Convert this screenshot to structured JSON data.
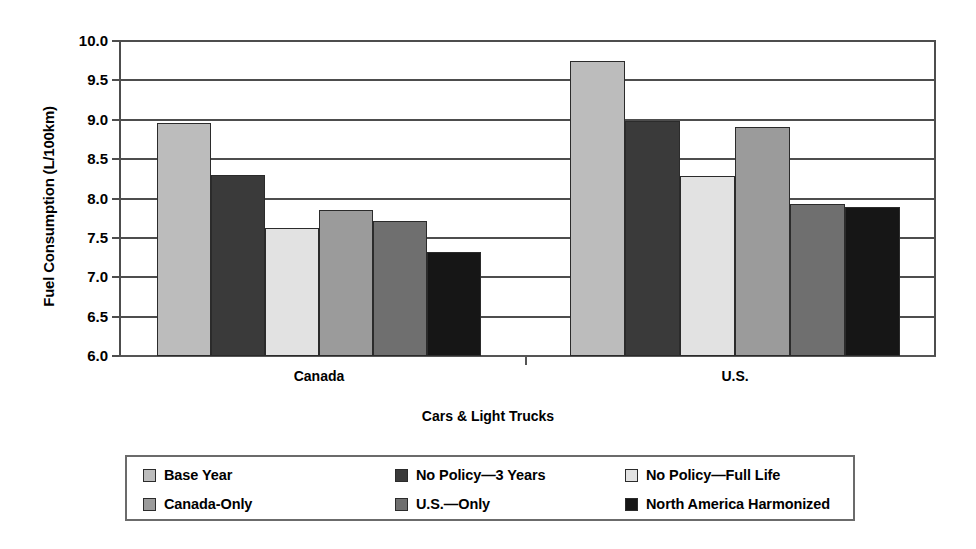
{
  "chart_data": {
    "type": "bar",
    "title": "",
    "xlabel": "Cars & Light Trucks",
    "ylabel": "Fuel Consumption (L/100km)",
    "ylim": [
      6.0,
      10.0
    ],
    "ytick_labels": [
      "10.0",
      "9.5",
      "9.0",
      "8.5",
      "8.0",
      "7.5",
      "7.0",
      "6.5",
      "6.0"
    ],
    "ytick_values": [
      10.0,
      9.5,
      9.0,
      8.5,
      8.0,
      7.5,
      7.0,
      6.5,
      6.0
    ],
    "grid": true,
    "legend_position": "below-axes",
    "categories": [
      "Canada",
      "U.S."
    ],
    "series": [
      {
        "name": "Base Year",
        "color": "#bcbcbc",
        "values": [
          8.96,
          9.74
        ]
      },
      {
        "name": "No Policy—3 Years",
        "color": "#3a3a3a",
        "values": [
          8.3,
          8.98
        ]
      },
      {
        "name": "No Policy—Full Life",
        "color": "#e2e2e2",
        "values": [
          7.62,
          8.28
        ]
      },
      {
        "name": "Canada-Only",
        "color": "#9b9b9b",
        "values": [
          7.85,
          8.91
        ]
      },
      {
        "name": "U.S.—Only",
        "color": "#6f6f6f",
        "values": [
          7.72,
          7.93
        ]
      },
      {
        "name": "North America Harmonized",
        "color": "#161616",
        "values": [
          7.32,
          7.89
        ]
      }
    ]
  },
  "legend": {
    "rows": [
      [
        {
          "label": "Base Year",
          "color": "#bcbcbc"
        },
        {
          "label": "No Policy—3 Years",
          "color": "#3a3a3a"
        },
        {
          "label": "No Policy—Full Life",
          "color": "#e2e2e2"
        }
      ],
      [
        {
          "label": "Canada-Only",
          "color": "#9b9b9b"
        },
        {
          "label": "U.S.—Only",
          "color": "#6f6f6f"
        },
        {
          "label": "North America Harmonized",
          "color": "#161616"
        }
      ]
    ]
  }
}
